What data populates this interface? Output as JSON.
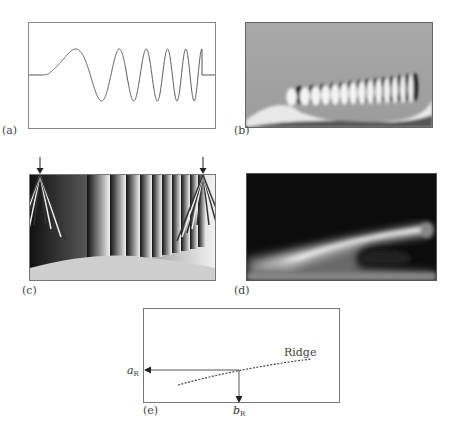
{
  "panels": {
    "a": {
      "label": "(a)",
      "description": "chirp signal waveform"
    },
    "b": {
      "label": "(b)",
      "description": "wavelet transform real part"
    },
    "c": {
      "label": "(c)",
      "description": "wavelet transform phase"
    },
    "d": {
      "label": "(d)",
      "description": "wavelet transform modulus"
    },
    "e": {
      "label": "(e)",
      "description": "ridge extraction schematic",
      "ridge_label": "Ridge",
      "a_axis": {
        "main": "a",
        "sub": "R"
      },
      "b_axis": {
        "main": "b",
        "sub": "R"
      }
    }
  },
  "colors": {
    "line": "#555555",
    "border": "#777777",
    "background": "#ffffff"
  }
}
